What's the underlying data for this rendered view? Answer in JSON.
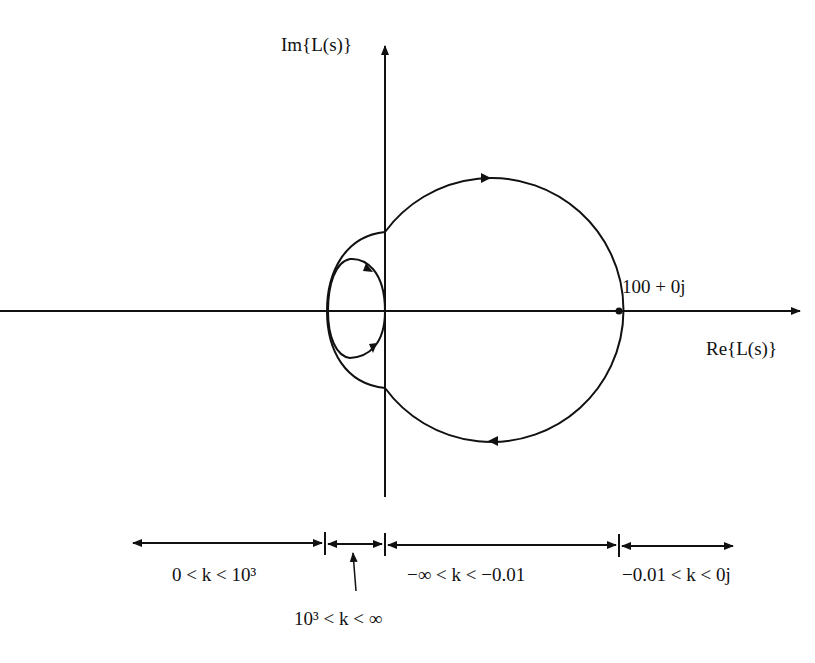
{
  "diagram": {
    "type": "nyquist-plot",
    "axes": {
      "imag_label": "Im{L(s)}",
      "real_label": "Re{L(s)}"
    },
    "point_label": "100 + 0j",
    "ranges": [
      {
        "label": "0 < k < 10³"
      },
      {
        "label": "10³ < k < ∞"
      },
      {
        "label": "−∞ < k < −0.01"
      },
      {
        "label": "−0.01 < k < 0j"
      }
    ],
    "colors": {
      "stroke": "#111111",
      "background": "#ffffff"
    }
  }
}
